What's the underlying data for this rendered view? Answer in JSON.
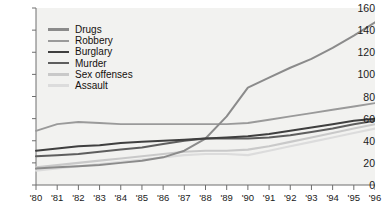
{
  "chart_data": {
    "type": "line",
    "title": "",
    "xlabel": "",
    "ylabel": "",
    "x": [
      "'80",
      "'81",
      "'82",
      "'83",
      "'84",
      "'85",
      "'86",
      "'87",
      "'88",
      "'89",
      "'90",
      "'91",
      "'92",
      "'93",
      "'94",
      "'95",
      "'96"
    ],
    "xlim": [
      0,
      16
    ],
    "ylim": [
      0,
      160
    ],
    "yticks": [
      0,
      20,
      40,
      60,
      80,
      100,
      120,
      140,
      160
    ],
    "grid": false,
    "legend_position": "top-left",
    "series": [
      {
        "name": "Drugs",
        "color": "#8b8b8b",
        "width": 2.0,
        "values": [
          15,
          16,
          17,
          18,
          20,
          22,
          25,
          31,
          42,
          62,
          88,
          97,
          106,
          114,
          124,
          135,
          147
        ]
      },
      {
        "name": "Robbery",
        "color": "#9a9a9a",
        "width": 1.9,
        "values": [
          49,
          55,
          57,
          56,
          55,
          55,
          55,
          55,
          55,
          55,
          56,
          59,
          62,
          65,
          68,
          71,
          74
        ]
      },
      {
        "name": "Burglary",
        "color": "#3f3f3f",
        "width": 2.0,
        "values": [
          31,
          33,
          35,
          36,
          38,
          39,
          40,
          41,
          42,
          43,
          44,
          46,
          49,
          52,
          55,
          58,
          60
        ]
      },
      {
        "name": "Murder",
        "color": "#5e5e5e",
        "width": 2.0,
        "values": [
          26,
          27,
          28,
          30,
          32,
          34,
          37,
          40,
          42,
          42,
          42,
          43,
          45,
          48,
          51,
          55,
          58
        ]
      },
      {
        "name": "Sex offenses",
        "color": "#c9c9c9",
        "width": 2.1,
        "values": [
          16,
          18,
          20,
          22,
          24,
          26,
          28,
          30,
          31,
          31,
          32,
          35,
          39,
          43,
          47,
          51,
          55
        ]
      },
      {
        "name": "Assault",
        "color": "#dcdcdc",
        "width": 2.1,
        "values": [
          13,
          15,
          17,
          19,
          21,
          23,
          25,
          27,
          28,
          28,
          27,
          31,
          35,
          39,
          43,
          47,
          51
        ]
      }
    ]
  }
}
